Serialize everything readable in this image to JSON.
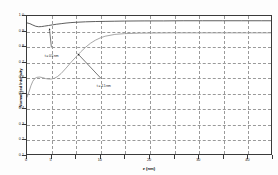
{
  "chart_data": {
    "type": "line",
    "title": "",
    "xlabel": "z (nm)",
    "ylabel": "Normalized Intensity",
    "xlim": [
      0,
      50
    ],
    "ylim": [
      0.1,
      1.0
    ],
    "grid": true,
    "legend_position": "none",
    "xticks": [
      0,
      5,
      10,
      15,
      20,
      25,
      30,
      35,
      40,
      45,
      50
    ],
    "xticklabels": [
      "0",
      "5",
      "10",
      "15",
      "20",
      "25",
      "30",
      "35",
      "40",
      "45",
      "50"
    ],
    "xticklabels_shown": [
      "0",
      "5",
      "",
      "10",
      "",
      "20",
      "",
      "30",
      "",
      "40",
      ""
    ],
    "yticks": [
      0.1,
      0.2,
      0.3,
      0.4,
      0.5,
      0.6,
      0.7,
      0.8,
      0.9,
      1.0
    ],
    "yticklabels": [
      "0.1",
      "0.2",
      "0.3",
      "0.4",
      "0.5",
      "0.6",
      "0.7",
      "0.8",
      "0.9",
      "1.0"
    ],
    "series": [
      {
        "name": "upper-curve",
        "color": "#4a4a4a",
        "x": [
          0.0,
          0.6,
          1.2,
          1.8,
          2.4,
          3.0,
          3.6,
          4.4,
          5.2,
          6.0,
          7.0,
          8.0,
          9.0,
          10.0,
          12.0,
          14.0,
          16.0,
          18.0,
          20.0,
          24.0,
          28.0,
          32.0,
          36.0,
          40.0,
          44.0,
          48.0,
          50.0
        ],
        "values": [
          0.955,
          0.95,
          0.941,
          0.933,
          0.93,
          0.931,
          0.934,
          0.938,
          0.942,
          0.946,
          0.95,
          0.954,
          0.957,
          0.959,
          0.962,
          0.964,
          0.965,
          0.966,
          0.967,
          0.968,
          0.968,
          0.969,
          0.969,
          0.969,
          0.969,
          0.969,
          0.969
        ]
      },
      {
        "name": "lower-curve",
        "color": "#9b9b9b",
        "x": [
          0.0,
          0.4,
          0.8,
          1.2,
          1.6,
          2.0,
          2.6,
          3.2,
          3.8,
          4.4,
          5.0,
          5.6,
          6.2,
          7.0,
          8.0,
          9.0,
          10.0,
          11.0,
          12.0,
          13.0,
          14.0,
          15.0,
          16.0,
          18.0,
          20.0,
          23.0,
          26.0,
          30.0,
          35.0,
          40.0,
          45.0,
          50.0
        ],
        "values": [
          0.47,
          0.505,
          0.545,
          0.575,
          0.592,
          0.6,
          0.602,
          0.598,
          0.592,
          0.589,
          0.589,
          0.594,
          0.604,
          0.625,
          0.66,
          0.697,
          0.732,
          0.766,
          0.796,
          0.822,
          0.842,
          0.857,
          0.868,
          0.88,
          0.885,
          0.888,
          0.889,
          0.89,
          0.89,
          0.89,
          0.89,
          0.89
        ]
      }
    ],
    "annotations": [
      {
        "name": "annotation-upper",
        "text": "t = 0.5 nm",
        "label_x": 5.0,
        "label_y": 0.755,
        "arrow_from_x": 5.0,
        "arrow_from_y": 0.795,
        "arrow_to_x": 4.6,
        "arrow_to_y": 0.918
      },
      {
        "name": "annotation-lower",
        "text": "t = 1.5 nm",
        "label_x": 15.6,
        "label_y": 0.56,
        "arrow_from_x": 15.2,
        "arrow_from_y": 0.592,
        "arrow_to_x": 10.4,
        "arrow_to_y": 0.754
      }
    ]
  },
  "axes": {
    "y_title": "Normalized Intensity",
    "x_title": "z (nm)"
  }
}
